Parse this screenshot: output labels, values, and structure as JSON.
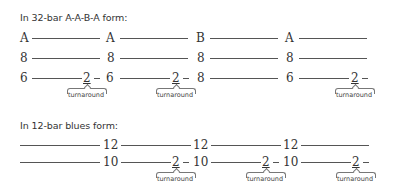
{
  "sections": {
    "aaba": {
      "heading": "In 32-bar A-A-B-A form:",
      "row1": [
        "A",
        "A",
        "B",
        "A"
      ],
      "row2": [
        "8",
        "8",
        "8",
        "8"
      ],
      "row3": [
        "6",
        "2",
        "6",
        "2",
        "8",
        "6",
        "2"
      ],
      "turnaround_label": "turnaround"
    },
    "blues": {
      "heading": "In 12-bar blues form:",
      "row1": [
        "12",
        "12",
        "12"
      ],
      "row2": [
        "10",
        "2",
        "10",
        "2",
        "10",
        "2"
      ],
      "turnaround_label": "turnaround"
    }
  }
}
